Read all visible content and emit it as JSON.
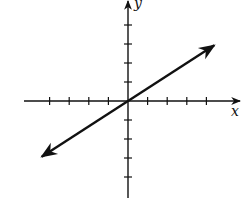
{
  "chart_data": {
    "type": "line",
    "title": "",
    "xlabel": "x",
    "ylabel": "y",
    "xlim": [
      -5.2,
      5.5
    ],
    "ylim": [
      -5.1,
      5.4
    ],
    "x_ticks": [
      -4,
      -3,
      -2,
      -1,
      1,
      2,
      3,
      4
    ],
    "y_ticks": [
      -4,
      -3,
      -2,
      -1,
      1,
      2,
      3,
      4
    ],
    "tick_labels_shown": false,
    "grid": false,
    "series": [
      {
        "name": "y = (2/3)x",
        "equation": "y = 2/3 x",
        "slope": 0.6667,
        "intercept": 0,
        "x": [
          -4.4,
          0,
          4.4
        ],
        "y": [
          -2.93,
          0,
          2.93
        ],
        "arrows_both_ends": true
      }
    ]
  },
  "colors": {
    "ink": "#111111",
    "background": "#ffffff"
  }
}
